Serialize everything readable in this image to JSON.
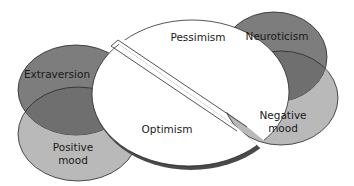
{
  "diagram": {
    "type": "venn-personality-mood",
    "colors": {
      "dark_trait": "#7a7a7a",
      "light_mood": "#b8b8b8",
      "overlap": "#6e6e6e",
      "outline": "#2a2a2a",
      "center_fill": "#ffffff",
      "rim": "#4a4a4a"
    },
    "left_cluster": {
      "trait": {
        "label": "Extraversion"
      },
      "mood": {
        "label_line1": "Positive",
        "label_line2": "mood"
      }
    },
    "center": {
      "upper_half": {
        "label": "Pessimism"
      },
      "lower_half": {
        "label": "Optimism"
      }
    },
    "right_cluster": {
      "trait": {
        "label": "Neuroticism"
      },
      "mood": {
        "label_line1": "Negative",
        "label_line2": "mood"
      }
    }
  }
}
